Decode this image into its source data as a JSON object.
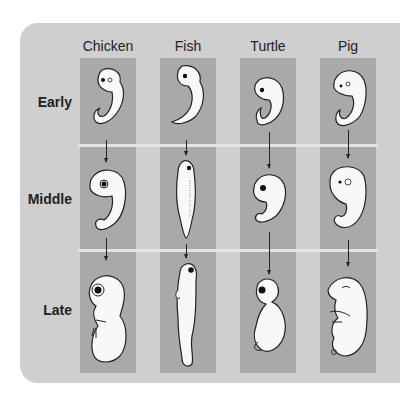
{
  "figure": {
    "columns": [
      "Chicken",
      "Fish",
      "Turtle",
      "Pig"
    ],
    "rows": [
      "Early",
      "Middle",
      "Late"
    ]
  },
  "colors": {
    "panel_bg": "#cfcfcf",
    "column_strip": "#a9a9a9",
    "row_divider": "#e4e4e4",
    "embryo_fill": "#f8f8f8",
    "outline": "#222222"
  },
  "icons": {
    "embryo": "embryo-illustration",
    "arrow": "arrow-down-icon"
  }
}
